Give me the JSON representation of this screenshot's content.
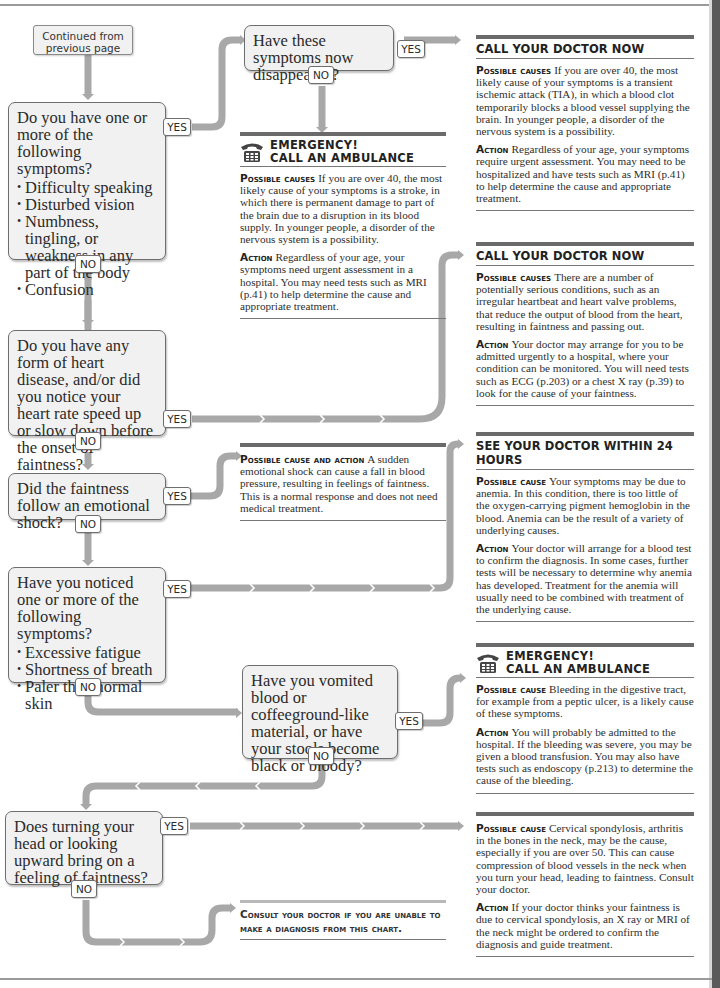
{
  "page": {
    "continued_label": "Continued from previous page",
    "yes_label": "YES",
    "no_label": "NO"
  },
  "questions": {
    "q1": {
      "text": "Do you have one or more of the following symptoms?",
      "bullets": [
        "Difficulty speaking",
        "Disturbed vision",
        "Numbness, tingling, or weakness in any part of the body",
        "Confusion"
      ]
    },
    "q1a": {
      "text": "Have these symptoms now disappeared?"
    },
    "q2": {
      "text": "Do you have any form of heart disease, and/or did you notice your heart rate speed up or slow down before the onset of faintness?"
    },
    "q3": {
      "text": "Did the faintness follow an emotional shock?"
    },
    "q4": {
      "text": "Have you noticed one or more of the following symptoms?",
      "bullets": [
        "Excessive fatigue",
        "Shortness of breath",
        "Paler than normal skin"
      ]
    },
    "q5": {
      "text": "Have you vomited blood or coffeeground-like material, or have your stools become black or bloody?"
    },
    "q6": {
      "text": "Does turning your head or looking upward bring on a feeling of faintness?"
    }
  },
  "answers": {
    "tia": {
      "heading": "CALL YOUR DOCTOR NOW",
      "causes_label": "Possible causes",
      "causes": "If you are over 40, the most likely cause of your symptoms is a transient ischemic attack (TIA), in which a blood clot temporarily blocks a blood vessel supplying the brain. In younger people, a disorder of the nervous system is a possibility.",
      "action_label": "Action",
      "action": "Regardless of your age, your symptoms require urgent assessment. You may need to be hospitalized and have tests such as MRI (p.41) to help determine the cause and appropriate treatment."
    },
    "stroke": {
      "heading_line1": "EMERGENCY!",
      "heading_line2": "CALL AN AMBULANCE",
      "icon": "telephone-icon",
      "causes_label": "Possible causes",
      "causes": "If you are over 40, the most likely cause of your symptoms is a stroke, in which there is permanent damage to part of the brain due to a disruption in its blood supply. In younger people, a disorder of the nervous system is a possibility.",
      "action_label": "Action",
      "action": "Regardless of your age, your symptoms need urgent assessment in a hospital. You may need tests such as MRI (p.41) to help determine the cause and appropriate treatment."
    },
    "heart": {
      "heading": "CALL YOUR DOCTOR NOW",
      "causes_label": "Possible causes",
      "causes": "There are a number of potentially serious conditions, such as an irregular heartbeat and heart valve problems, that reduce the output of blood from the heart, resulting in faintness and passing out.",
      "action_label": "Action",
      "action": "Your doctor may arrange for you to be admitted urgently to a hospital, where your condition can be monitored. You will need tests such as ECG (p.203) or a chest X ray (p.39) to look for the cause of your faintness."
    },
    "shock": {
      "label": "Possible cause and action",
      "text": "A sudden emotional shock can cause a fall in blood pressure, resulting in feelings of faintness. This is a normal response and does not need medical treatment."
    },
    "anemia": {
      "heading": "SEE YOUR DOCTOR WITHIN 24 HOURS",
      "causes_label": "Possible cause",
      "causes": "Your symptoms may be due to anemia. In this condition, there is too little of the oxygen-carrying pigment hemoglobin in the blood. Anemia can be the result of a variety of underlying causes.",
      "action_label": "Action",
      "action": "Your doctor will arrange for a blood test to confirm the diagnosis. In some cases, further tests will be necessary to determine why anemia has developed. Treatment for the anemia will usually need to be combined with treatment of the underlying cause."
    },
    "bleeding": {
      "heading_line1": "EMERGENCY!",
      "heading_line2": "CALL AN AMBULANCE",
      "icon": "telephone-icon",
      "causes_label": "Possible cause",
      "causes": "Bleeding in the digestive tract, for example from a peptic ulcer, is a likely cause of these symptoms.",
      "action_label": "Action",
      "action": "You will probably be admitted to the hospital. If the bleeding was severe, you may be given a blood transfusion. You may also have tests such as endoscopy (p.213) to determine the cause of the bleeding."
    },
    "spondylosis": {
      "causes_label": "Possible cause",
      "causes": "Cervical spondylosis, arthritis in the bones in the neck, may be the cause, especially if you are over 50. This can cause compression of blood vessels in the neck when you turn your head, leading to faintness. Consult your doctor.",
      "action_label": "Action",
      "action": "If your doctor thinks your faintness is due to cervical spondylosis, an X ray or MRI of the neck might be ordered to confirm the diagnosis and guide treatment."
    },
    "consult": {
      "text": "Consult your doctor if you are unable to make a diagnosis from this chart."
    }
  },
  "colors": {
    "connector": "#a8a8a8",
    "box_fill": "#f1f1f1",
    "box_border": "#6e6e6e",
    "heading_bar": "#6a6a6a",
    "page_edge": "#5a5a5a"
  }
}
